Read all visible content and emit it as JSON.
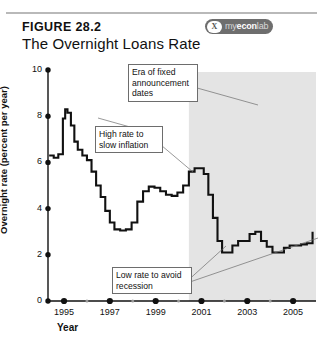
{
  "header": {
    "figure_number": "FIGURE 28.2",
    "title": "The Overnight Loans Rate",
    "logo": {
      "badge": "X",
      "prefix": "my",
      "mid": "econ",
      "suffix": "lab"
    }
  },
  "chart_data": {
    "type": "line",
    "title": "The Overnight Loans Rate",
    "xlabel": "Year",
    "ylabel": "Overnight rate (percent per year)",
    "xlim": [
      1994.3,
      2006.0
    ],
    "ylim": [
      0,
      10
    ],
    "yticks": [
      0,
      2,
      4,
      6,
      8,
      10
    ],
    "xticks": [
      1995,
      1997,
      1999,
      2001,
      2003,
      2005
    ],
    "minor_xticks": [
      1996,
      1998,
      2000,
      2002,
      2004
    ],
    "grid": false,
    "legend": null,
    "series": [
      {
        "name": "Overnight rate",
        "x": [
          1994.35,
          1994.55,
          1994.75,
          1994.95,
          1995.05,
          1995.15,
          1995.3,
          1995.45,
          1995.6,
          1995.8,
          1996.0,
          1996.2,
          1996.4,
          1996.6,
          1996.8,
          1997.0,
          1997.2,
          1997.45,
          1997.7,
          1997.95,
          1998.2,
          1998.45,
          1998.7,
          1998.95,
          1999.2,
          1999.45,
          1999.7,
          1999.95,
          2000.2,
          2000.45,
          2000.7,
          2000.95,
          2001.1,
          2001.3,
          2001.5,
          2001.7,
          2001.9,
          2002.1,
          2002.35,
          2002.6,
          2002.85,
          2003.1,
          2003.35,
          2003.6,
          2003.85,
          2004.1,
          2004.35,
          2004.6,
          2004.85,
          2005.1,
          2005.35,
          2005.6,
          2005.85
        ],
        "y": [
          6.3,
          6.2,
          6.35,
          7.9,
          8.3,
          8.15,
          7.6,
          6.9,
          6.55,
          6.3,
          6.1,
          5.6,
          5.0,
          4.5,
          3.9,
          3.4,
          3.1,
          3.05,
          3.1,
          3.4,
          4.3,
          4.75,
          4.95,
          4.9,
          4.75,
          4.6,
          4.55,
          4.7,
          5.0,
          5.6,
          5.75,
          5.75,
          5.5,
          4.6,
          3.6,
          2.6,
          2.1,
          2.1,
          2.4,
          2.6,
          2.6,
          2.9,
          3.0,
          2.6,
          2.35,
          2.1,
          2.1,
          2.3,
          2.4,
          2.4,
          2.45,
          2.5,
          3.0
        ]
      }
    ],
    "shaded_region": {
      "label": "Era of fixed announcement dates",
      "x_start": 2000.45,
      "x_end": 2006.0,
      "color": "#e4e4e4"
    },
    "annotations": [
      {
        "id": "era-note",
        "text": "Era of fixed announcement dates"
      },
      {
        "id": "high-rate-note",
        "text": "High rate to slow inflation"
      },
      {
        "id": "low-rate-note",
        "text": "Low rate to avoid recession"
      }
    ]
  }
}
